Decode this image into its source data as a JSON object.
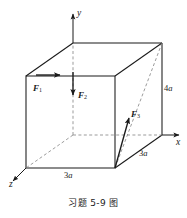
{
  "figure": {
    "caption": "习题 5-9 图",
    "type": "physics-diagram",
    "colors": {
      "stroke": "#1a1a1a",
      "hidden_stroke": "#7a7a7a",
      "background": "#ffffff"
    },
    "axes": [
      {
        "id": "y",
        "label": "y",
        "direction": "up"
      },
      {
        "id": "x",
        "label": "x",
        "direction": "right"
      },
      {
        "id": "z",
        "label": "z",
        "direction": "lower-left"
      }
    ],
    "forces": [
      {
        "id": "F1",
        "label": "F",
        "subscript": "1",
        "direction": "horizontal-right"
      },
      {
        "id": "F2",
        "label": "F",
        "subscript": "2",
        "direction": "vertical-down"
      },
      {
        "id": "F3",
        "label": "F",
        "subscript": "3",
        "direction": "diagonal-up-right"
      }
    ],
    "dimensions": [
      {
        "id": "height-right",
        "value": "4",
        "unit": "a",
        "edge": "right-vertical"
      },
      {
        "id": "depth-right",
        "value": "3",
        "unit": "a",
        "edge": "bottom-right-diagonal"
      },
      {
        "id": "width-bottom",
        "value": "3",
        "unit": "a",
        "edge": "bottom-front"
      }
    ]
  }
}
